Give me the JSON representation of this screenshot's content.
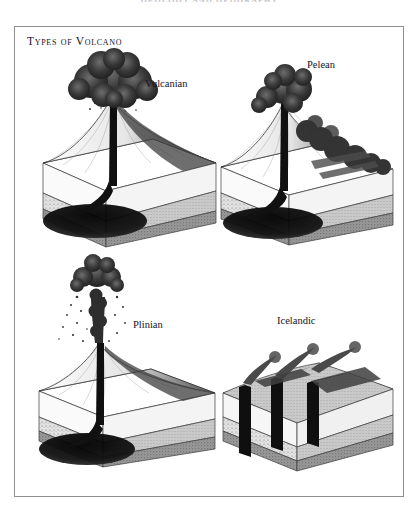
{
  "page": {
    "running_header": "GEOLOGY AND GEOGRAPHY",
    "background_color": "#ffffff",
    "frame_color": "#8f8f93"
  },
  "plate": {
    "title": "Types of Volcano",
    "ink_color": "#15131a"
  },
  "figures": [
    {
      "id": "vulcanian",
      "label": "Vulcanian",
      "description": "Block diagram of a Vulcanian volcano: steep cone with a narrow vertical conduit rising from a dark magma chamber, topped by a large billowing mushroom-shaped ash cloud; cutaway shows layered strata.",
      "plume": "large mushroom ash cloud"
    },
    {
      "id": "pelean",
      "label": "Pelean",
      "description": "Block diagram of a Pelean volcano: cone with a dense dark ash cloud that collapses and flows down the right flank as a pyroclastic surge across the land surface.",
      "plume": "collapsing column with pyroclastic flow"
    },
    {
      "id": "plinian",
      "label": "Plinian",
      "description": "Block diagram of a Plinian volcano: very tall narrow eruption column of ash rising high above the cone and spreading into a small cap cloud, with scattered tephra falling on either side.",
      "plume": "tall sustained eruption column"
    },
    {
      "id": "icelandic",
      "label": "Icelandic",
      "description": "Block diagram of an Icelandic fissure eruption: the ground block is cut by several vertical dykes feeding linear fissures at the surface, each emitting a low drifting smoke plume; no central cone.",
      "plume": "low fissure plumes"
    }
  ],
  "strata": {
    "layers": [
      {
        "name": "topsoil",
        "color": "#ffffff"
      },
      {
        "name": "upper sediment",
        "color": "#f2f2f2"
      },
      {
        "name": "stippled sandstone",
        "color": "#dcdcdc"
      },
      {
        "name": "lower bedrock",
        "color": "#9c9c9c"
      }
    ],
    "magma_color": "#121212"
  }
}
